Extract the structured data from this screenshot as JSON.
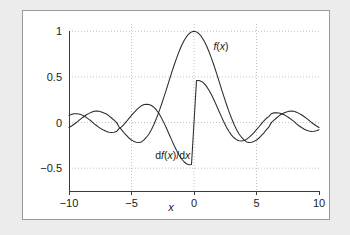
{
  "figure": {
    "background_color": "#ececed",
    "card_color": "#ffffff",
    "card_border_color": "#9a9a9a"
  },
  "chart_data": {
    "type": "line",
    "title": "",
    "subtitle": "",
    "xlabel": "x",
    "ylabel": "",
    "xlim": [
      -10,
      10
    ],
    "ylim": [
      -0.75,
      1.08
    ],
    "grid": true,
    "grid_style": "dotted",
    "grid_color": "#b4b4b4",
    "legend_position": "inline-annotations",
    "xticks": [
      -10,
      -5,
      0,
      5,
      10
    ],
    "xticklabels": [
      "−10",
      "−5",
      "0",
      "5",
      "10"
    ],
    "yticks": [
      -0.5,
      0,
      0.5,
      1
    ],
    "yticklabels": [
      "−0.5",
      "0",
      "0.5",
      "1"
    ],
    "annotations": [
      {
        "text_html": "<tspan class=\"it\">f</tspan>(<tspan class=\"it\">x</tspan>)",
        "x": 1.55,
        "y": 0.8
      },
      {
        "text_html": "d<tspan class=\"it\">f</tspan>(<tspan class=\"it\">x</tspan>)/d<tspan class=\"it\">x</tspan>",
        "x": -3.1,
        "y": -0.4
      }
    ],
    "series": [
      {
        "name": "f(x)",
        "label": "f(x)",
        "formula": "sin(x)/x",
        "color": "#2b2b2b",
        "x": [
          -10,
          -9.8,
          -9.6,
          -9.4,
          -9.2,
          -9,
          -8.8,
          -8.6,
          -8.4,
          -8.2,
          -8,
          -7.8,
          -7.6,
          -7.4,
          -7.2,
          -7,
          -6.8,
          -6.6,
          -6.4,
          -6.2,
          -6,
          -5.8,
          -5.6,
          -5.4,
          -5.2,
          -5,
          -4.8,
          -4.6,
          -4.4,
          -4.2,
          -4,
          -3.8,
          -3.6,
          -3.4,
          -3.2,
          -3,
          -2.8,
          -2.6,
          -2.4,
          -2.2,
          -2,
          -1.8,
          -1.6,
          -1.4,
          -1.2,
          -1,
          -0.8,
          -0.6,
          -0.4,
          -0.2,
          0,
          0.2,
          0.4,
          0.6,
          0.8,
          1,
          1.2,
          1.4,
          1.6,
          1.8,
          2,
          2.2,
          2.4,
          2.6,
          2.8,
          3,
          3.2,
          3.4,
          3.6,
          3.8,
          4,
          4.2,
          4.4,
          4.6,
          4.8,
          5,
          5.2,
          5.4,
          5.6,
          5.8,
          6,
          6.2,
          6.4,
          6.6,
          6.8,
          7,
          7.2,
          7.4,
          7.6,
          7.8,
          8,
          8.2,
          8.4,
          8.6,
          8.8,
          9,
          9.2,
          9.4,
          9.6,
          9.8,
          10
        ],
        "y": [
          -0.0544,
          -0.0375,
          -0.0186,
          0.0012,
          0.0239,
          0.0458,
          0.0666,
          0.0852,
          0.1005,
          0.1118,
          0.1237,
          0.1259,
          0.1234,
          0.1163,
          0.1049,
          0.0939,
          0.0726,
          0.05,
          0.0262,
          0.0021,
          -0.0466,
          -0.077,
          -0.1122,
          -0.1408,
          -0.1694,
          -0.1918,
          -0.2066,
          -0.2155,
          -0.2174,
          -0.2121,
          -0.1892,
          -0.1605,
          -0.1248,
          -0.0761,
          -0.0181,
          0.047,
          0.1197,
          0.1977,
          0.2806,
          0.3665,
          0.4546,
          0.5415,
          0.6253,
          0.7039,
          0.7767,
          0.8415,
          0.8967,
          0.9411,
          0.9735,
          0.9933,
          1.0,
          0.9933,
          0.9735,
          0.9411,
          0.8967,
          0.8415,
          0.7767,
          0.7039,
          0.6253,
          0.5415,
          0.4546,
          0.3665,
          0.2806,
          0.1977,
          0.1197,
          0.047,
          -0.0181,
          -0.0761,
          -0.1248,
          -0.1605,
          -0.1892,
          -0.2121,
          -0.2174,
          -0.2155,
          -0.2066,
          -0.1918,
          -0.1694,
          -0.1408,
          -0.1122,
          -0.077,
          -0.0466,
          0.0021,
          0.0262,
          0.05,
          0.0726,
          0.0939,
          0.1049,
          0.1163,
          0.1234,
          0.1259,
          0.1237,
          0.1118,
          0.1005,
          0.0852,
          0.0666,
          0.0458,
          0.0239,
          0.0012,
          -0.0186,
          -0.0375,
          -0.0544
        ]
      },
      {
        "name": "df(x)/dx",
        "label": "df(x)/dx",
        "formula": "cos(x)/x - sin(x)/x^2",
        "color": "#2b2b2b",
        "x": [
          -10,
          -9.8,
          -9.6,
          -9.4,
          -9.2,
          -9,
          -8.8,
          -8.6,
          -8.4,
          -8.2,
          -8,
          -7.8,
          -7.6,
          -7.4,
          -7.2,
          -7,
          -6.8,
          -6.6,
          -6.4,
          -6.2,
          -6,
          -5.8,
          -5.6,
          -5.4,
          -5.2,
          -5,
          -4.8,
          -4.6,
          -4.4,
          -4.2,
          -4,
          -3.8,
          -3.6,
          -3.4,
          -3.2,
          -3,
          -2.8,
          -2.6,
          -2.4,
          -2.2,
          -2,
          -1.8,
          -1.6,
          -1.4,
          -1.2,
          -1,
          -0.8,
          -0.6,
          -0.4,
          -0.2,
          0,
          0.2,
          0.4,
          0.6,
          0.8,
          1,
          1.2,
          1.4,
          1.6,
          1.8,
          2,
          2.2,
          2.4,
          2.6,
          2.8,
          3,
          3.2,
          3.4,
          3.6,
          3.8,
          4,
          4.2,
          4.4,
          4.6,
          4.8,
          5,
          5.2,
          5.4,
          5.6,
          5.8,
          6,
          6.2,
          6.4,
          6.6,
          6.8,
          7,
          7.2,
          7.4,
          7.6,
          7.8,
          8,
          8.2,
          8.4,
          8.6,
          8.8,
          9,
          9.2,
          9.4,
          9.6,
          9.8,
          10
        ],
        "y": [
          0.0784,
          0.0897,
          0.096,
          0.0972,
          0.0932,
          0.0843,
          0.0711,
          0.0543,
          0.0349,
          0.014,
          -0.0124,
          -0.0326,
          -0.0528,
          -0.0709,
          -0.0854,
          -0.0974,
          -0.1051,
          -0.1081,
          -0.106,
          -0.0992,
          -0.067,
          -0.0478,
          -0.0197,
          0.012,
          0.0456,
          0.0782,
          0.1096,
          0.1387,
          0.1633,
          0.1846,
          0.1969,
          0.2012,
          0.1989,
          0.1873,
          0.1669,
          0.1378,
          0.098,
          0.0508,
          -0.0035,
          -0.0627,
          -0.1248,
          -0.1872,
          -0.2478,
          -0.3044,
          -0.3546,
          -0.3968,
          -0.4293,
          -0.4511,
          -0.4615,
          -0.4603,
          -0.0,
          0.4603,
          0.4615,
          0.4511,
          0.4293,
          0.3968,
          0.3546,
          0.3044,
          0.2478,
          0.1872,
          0.1248,
          0.0627,
          0.0035,
          -0.0508,
          -0.098,
          -0.1378,
          -0.1669,
          -0.1873,
          -0.1989,
          -0.2012,
          -0.1969,
          -0.1846,
          -0.1633,
          -0.1387,
          -0.1096,
          -0.0782,
          -0.0456,
          -0.012,
          0.0197,
          0.0478,
          0.067,
          0.0992,
          0.106,
          0.1081,
          0.1051,
          0.0974,
          0.0854,
          0.0709,
          0.0528,
          0.0326,
          0.0124,
          -0.014,
          -0.0349,
          -0.0543,
          -0.0711,
          -0.0843,
          -0.0932,
          -0.0972,
          -0.096,
          -0.0897,
          -0.0784
        ]
      }
    ]
  }
}
